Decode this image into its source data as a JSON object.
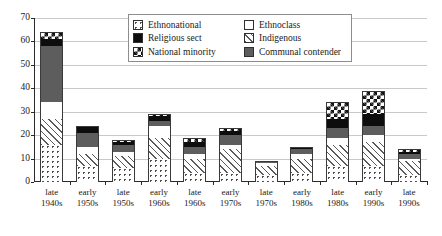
{
  "chart_data": {
    "type": "bar",
    "subtype": "stacked-bar",
    "title": "",
    "xlabel": "",
    "ylabel": "",
    "ylim": [
      0,
      70
    ],
    "ytick_step": 10,
    "yticks": [
      "0",
      "10",
      "20",
      "30",
      "40",
      "50",
      "60",
      "70"
    ],
    "grid": true,
    "legend_position": "top-center",
    "categories": [
      "late\n1940s",
      "early\n1950s",
      "late\n1950s",
      "early\n1960s",
      "late\n1960s",
      "early\n1970s",
      "late\n1970s",
      "early\n1980s",
      "late\n1980s",
      "early\n1990s",
      "late\n1990s"
    ],
    "category_lines": [
      [
        "late",
        "1940s"
      ],
      [
        "early",
        "1950s"
      ],
      [
        "late",
        "1950s"
      ],
      [
        "early",
        "1960s"
      ],
      [
        "late",
        "1960s"
      ],
      [
        "early",
        "1970s"
      ],
      [
        "late",
        "1970s"
      ],
      [
        "early",
        "1980s"
      ],
      [
        "late",
        "1980s"
      ],
      [
        "early",
        "1990s"
      ],
      [
        "late",
        "1990s"
      ]
    ],
    "stack_order_bottom_to_top": [
      "Ethnonational",
      "Indigenous",
      "Ethnoclass",
      "Communal contender",
      "Religious sect",
      "National minority"
    ],
    "series": [
      {
        "name": "Ethnonational",
        "pattern": "dotted",
        "values": [
          16,
          7,
          6,
          10,
          4,
          4,
          3,
          4,
          7,
          7,
          3
        ]
      },
      {
        "name": "Indigenous",
        "pattern": "diagonal-hatch",
        "values": [
          11,
          5,
          5,
          9,
          6,
          10,
          4,
          6,
          9,
          10,
          6
        ]
      },
      {
        "name": "Ethnoclass",
        "pattern": "solid-white",
        "values": [
          7,
          3,
          2,
          5,
          2,
          2,
          1,
          2,
          3,
          3,
          1
        ]
      },
      {
        "name": "Communal contender",
        "pattern": "solid-gray",
        "values": [
          24,
          6,
          3,
          2,
          3,
          4,
          1,
          2,
          4,
          4,
          2
        ]
      },
      {
        "name": "Religious sect",
        "pattern": "solid-black",
        "values": [
          3,
          3,
          1,
          2,
          2,
          2,
          0,
          1,
          4,
          5,
          1
        ]
      },
      {
        "name": "National minority",
        "pattern": "checkerboard",
        "values": [
          3,
          0,
          1,
          1,
          2,
          1,
          0,
          0,
          7,
          10,
          1
        ]
      }
    ],
    "totals": [
      64,
      24,
      18,
      29,
      19,
      23,
      9,
      15,
      34,
      39,
      14
    ]
  },
  "legend": {
    "items": [
      {
        "label": "Ethnonational",
        "swatch": "dotted-swatch"
      },
      {
        "label": "Religious sect",
        "swatch": "black-swatch"
      },
      {
        "label": "National minority",
        "swatch": "checker-swatch"
      },
      {
        "label": "Ethnoclass",
        "swatch": "white-swatch"
      },
      {
        "label": "Indigenous",
        "swatch": "hatch-swatch"
      },
      {
        "label": "Communal contender",
        "swatch": "gray-swatch"
      }
    ]
  },
  "colors": {
    "axis": "#2a2a2a",
    "grid": "#c9c9c9",
    "gray_fill": "#5d5d5d",
    "black_fill": "#0d0d0d",
    "background": "#ffffff"
  }
}
